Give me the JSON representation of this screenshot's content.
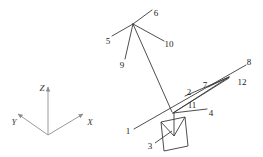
{
  "figure": {
    "background_color": "#ffffff",
    "stroke_color": "#3a3a3a",
    "axis_color": "#9a9a9a",
    "text_color": "#1a1a1a",
    "width": 263,
    "height": 157
  },
  "axes": {
    "origin": {
      "x": 48,
      "y": 135
    },
    "items": [
      {
        "name": "z-axis",
        "label": "Z",
        "label_x": 42,
        "label_y": 88,
        "tip_x": 48,
        "tip_y": 84
      },
      {
        "name": "y-axis",
        "label": "Y",
        "label_x": 14,
        "label_y": 122,
        "tip_x": 15,
        "tip_y": 112
      },
      {
        "name": "x-axis",
        "label": "X",
        "label_x": 90,
        "label_y": 122,
        "tip_x": 86,
        "tip_y": 112
      }
    ]
  },
  "diagram": {
    "hub": {
      "x": 133,
      "y": 24
    },
    "convergence": {
      "x": 230,
      "y": 77
    },
    "lower_node": {
      "x": 172,
      "y": 112
    },
    "labels": [
      {
        "id": "1",
        "x": 128,
        "y": 131
      },
      {
        "id": "2",
        "x": 189,
        "y": 92
      },
      {
        "id": "3",
        "x": 150,
        "y": 146
      },
      {
        "id": "4",
        "x": 211,
        "y": 113
      },
      {
        "id": "5",
        "x": 108,
        "y": 41
      },
      {
        "id": "6",
        "x": 156,
        "y": 13
      },
      {
        "id": "7",
        "x": 205,
        "y": 85
      },
      {
        "id": "8",
        "x": 249,
        "y": 62
      },
      {
        "id": "9",
        "x": 122,
        "y": 65
      },
      {
        "id": "10",
        "x": 169,
        "y": 44
      },
      {
        "id": "11",
        "x": 192,
        "y": 105
      },
      {
        "id": "12",
        "x": 242,
        "y": 82
      }
    ]
  }
}
